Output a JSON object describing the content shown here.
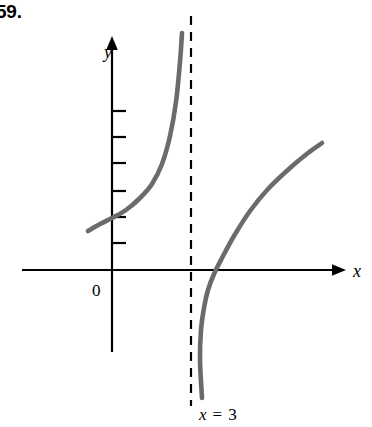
{
  "figure": {
    "problem_number": "59.",
    "origin_label": "0",
    "x_axis_label": "x",
    "y_axis_label": "y",
    "asymptote_label_var": "x",
    "asymptote_label_eq": "=",
    "asymptote_label_value": "3",
    "asymptote_label_full": "x = 3",
    "curve_color": "#6b6b6b",
    "axis_color": "#000000",
    "asymptote_color": "#000000",
    "background_color": "#ffffff"
  },
  "chart_data": {
    "type": "line",
    "title": "",
    "xlabel": "x",
    "ylabel": "y",
    "grid": false,
    "legend": null,
    "annotations": [
      {
        "text": "x = 3",
        "type": "vertical-asymptote",
        "x": 3
      },
      {
        "text": "0",
        "type": "origin-label",
        "x": 0,
        "y": 0
      }
    ],
    "axes": {
      "x_axis_y_pixel": 270,
      "y_axis_x_pixel": 112,
      "x_axis_arrow": "right",
      "y_axis_arrow": "up",
      "y_tick_count": 6,
      "y_tick_spacing_px": 24,
      "x_tick_count": 0
    },
    "series": [
      {
        "name": "left-branch",
        "description": "increasing branch left of the vertical asymptote x = 3, rising steeply toward +infinity as x approaches 3 from the left",
        "points_px": [
          [
            88,
            231
          ],
          [
            100,
            224
          ],
          [
            112,
            218
          ],
          [
            126,
            210
          ],
          [
            140,
            198
          ],
          [
            152,
            184
          ],
          [
            162,
            164
          ],
          [
            170,
            136
          ],
          [
            176,
            102
          ],
          [
            180,
            62
          ],
          [
            182,
            33
          ]
        ]
      },
      {
        "name": "right-branch",
        "description": "increasing branch right of the vertical asymptote x = 3, rising from -infinity near x = 3 and crossing the x-axis, flattening as x increases",
        "points_px": [
          [
            202,
            398
          ],
          [
            200,
            360
          ],
          [
            201,
            330
          ],
          [
            204,
            308
          ],
          [
            208,
            290
          ],
          [
            214,
            274
          ],
          [
            222,
            258
          ],
          [
            234,
            236
          ],
          [
            250,
            211
          ],
          [
            268,
            189
          ],
          [
            290,
            168
          ],
          [
            308,
            153
          ],
          [
            322,
            143
          ]
        ]
      }
    ],
    "asymptote_px": {
      "x": 191,
      "y_top": 16,
      "y_bottom": 406
    }
  }
}
